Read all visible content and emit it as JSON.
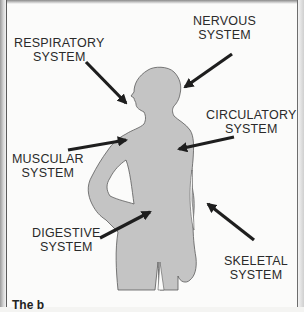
{
  "diagram": {
    "figure_fill": "#c4c4c4",
    "figure_outline": "#5a5a5a",
    "arrow_color": "#1e1e1e",
    "labels": [
      {
        "id": "respiratory",
        "line1": "RESPIRATORY",
        "line2": "SYSTEM"
      },
      {
        "id": "nervous",
        "line1": "NERVOUS",
        "line2": "SYSTEM"
      },
      {
        "id": "circulatory",
        "line1": "CIRCULATORY",
        "line2": "SYSTEM"
      },
      {
        "id": "muscular",
        "line1": "MUSCULAR",
        "line2": "SYSTEM"
      },
      {
        "id": "digestive",
        "line1": "DIGESTIVE",
        "line2": "SYSTEM"
      },
      {
        "id": "skeletal",
        "line1": "SKELETAL",
        "line2": "SYSTEM"
      }
    ],
    "caption": "The b"
  }
}
